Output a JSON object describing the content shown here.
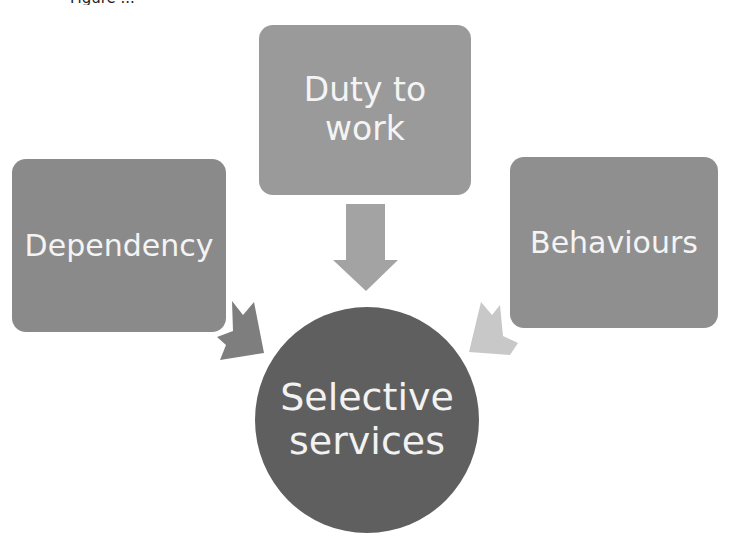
{
  "caption": "Figure ...",
  "diagram": {
    "inputs": [
      {
        "id": "duty",
        "label_lines": [
          "Duty to",
          "work"
        ],
        "position": "top",
        "color": "#9a9a9a"
      },
      {
        "id": "dependency",
        "label_lines": [
          "Dependency"
        ],
        "position": "left",
        "color": "#8a8a8a"
      },
      {
        "id": "behaviours",
        "label_lines": [
          "Behaviours"
        ],
        "position": "right",
        "color": "#8f8f8f"
      }
    ],
    "center": {
      "label_lines": [
        "Selective",
        "services"
      ],
      "color": "#5f5f5f"
    },
    "arrows": [
      {
        "from": "duty",
        "to": "center",
        "color": "#a3a3a3"
      },
      {
        "from": "dependency",
        "to": "center",
        "color": "#7e7e7e"
      },
      {
        "from": "behaviours",
        "to": "center",
        "color": "#c8c8c8"
      }
    ]
  }
}
